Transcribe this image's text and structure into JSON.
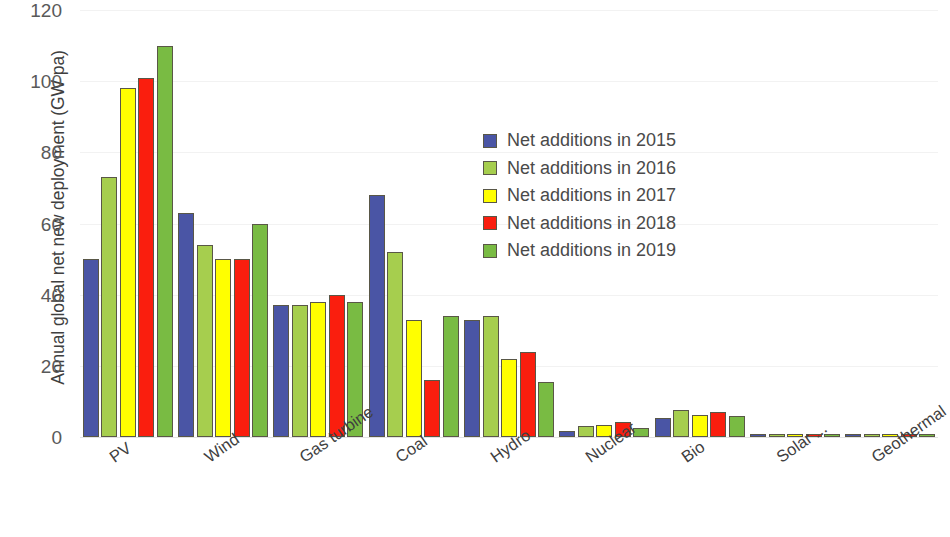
{
  "chart_data": {
    "type": "bar",
    "title": "",
    "xlabel": "",
    "ylabel": "Annual global net new deployment (GW pa)",
    "ylim": [
      0,
      120
    ],
    "yticks": [
      0,
      20,
      40,
      60,
      80,
      100,
      120
    ],
    "ytick_labels": [
      "0",
      "20",
      "40",
      "60",
      "80",
      "100",
      "120"
    ],
    "grid": true,
    "legend_position": "center",
    "categories": [
      "PV",
      "Wind",
      "Gas turbine",
      "Coal",
      "Hydro",
      "Nuclear",
      "Bio",
      "Solar ...",
      "Geothermal"
    ],
    "series": [
      {
        "name": "Net additions in 2015",
        "color": "#4a55a5",
        "values": [
          50,
          63,
          37,
          68,
          33,
          1.8,
          5.3,
          0.3,
          0.4
        ]
      },
      {
        "name": "Net additions in 2016",
        "color": "#a6ce4e",
        "values": [
          73,
          54,
          37,
          52,
          34,
          3.0,
          7.5,
          0.3,
          0.3
        ]
      },
      {
        "name": "Net additions in 2017",
        "color": "#ffff00",
        "values": [
          98,
          50,
          38,
          33,
          22,
          3.5,
          6.3,
          0.3,
          0.5
        ]
      },
      {
        "name": "Net additions in 2018",
        "color": "#fa1e0e",
        "values": [
          101,
          50,
          40,
          16,
          24,
          4.3,
          7.0,
          0.5,
          0.5
        ]
      },
      {
        "name": "Net additions in 2019",
        "color": "#79bb43",
        "values": [
          110,
          60,
          38,
          34,
          15.5,
          2.6,
          6.0,
          0.4,
          0.3
        ]
      }
    ]
  }
}
